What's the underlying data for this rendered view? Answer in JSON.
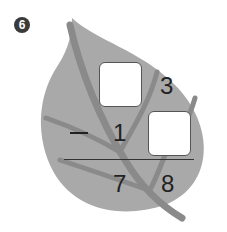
{
  "problem": {
    "number": "6",
    "operator": "−",
    "top": {
      "tens": "",
      "ones": "3"
    },
    "subtract": {
      "tens": "1",
      "ones": ""
    },
    "result": {
      "tens": "7",
      "ones": "8"
    }
  },
  "colors": {
    "leaf": "#a9a9a9",
    "vein": "#8a8a8a",
    "text": "#222222"
  }
}
